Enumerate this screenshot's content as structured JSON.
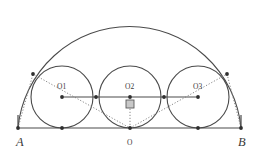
{
  "figure": {
    "background_color": "#ffffff",
    "stroke_color": "#4a4a4a",
    "dotted_color": "#7a7a7a",
    "label_color": "#3a3a3a",
    "width": 259,
    "height": 152
  },
  "labels": {
    "A": "A",
    "B": "B",
    "O": "O",
    "O1": "O1",
    "O2": "O2",
    "O3": "O3"
  },
  "chart_data": {
    "type": "diagram",
    "baseline": {
      "x1": 18,
      "y1": 128,
      "x2": 241,
      "y2": 128
    },
    "points": [
      {
        "name": "A",
        "x": 18,
        "y": 128,
        "label": "A",
        "label_x": 16,
        "label_y": 146,
        "marker": "dot"
      },
      {
        "name": "B",
        "x": 241,
        "y": 128,
        "label": "B",
        "label_x": 238,
        "label_y": 146,
        "marker": "dot"
      },
      {
        "name": "O",
        "x": 130,
        "y": 128,
        "label": "O",
        "label_x": 127,
        "label_y": 145,
        "marker": "dot"
      },
      {
        "name": "O1",
        "x": 62,
        "y": 97,
        "label": "O1",
        "label_x": 57,
        "label_y": 89,
        "marker": "dot"
      },
      {
        "name": "O2",
        "x": 130,
        "y": 97,
        "label": "O2",
        "label_x": 125,
        "label_y": 89,
        "marker": "dot"
      },
      {
        "name": "O3",
        "x": 198,
        "y": 97,
        "label": "O3",
        "label_x": 193,
        "label_y": 89,
        "marker": "dot"
      },
      {
        "name": "T_A",
        "x": 62,
        "y": 128,
        "label": "",
        "marker": "dot"
      },
      {
        "name": "T_B",
        "x": 198,
        "y": 128,
        "label": "",
        "marker": "dot"
      },
      {
        "name": "P_left",
        "x": 33,
        "y": 74,
        "label": "",
        "marker": "dot"
      },
      {
        "name": "P_right",
        "x": 227,
        "y": 74,
        "label": "",
        "marker": "dot"
      },
      {
        "name": "Q_left",
        "x": 96,
        "y": 97,
        "label": "",
        "marker": "dot"
      },
      {
        "name": "Q_right",
        "x": 164,
        "y": 97,
        "label": "",
        "marker": "dot"
      }
    ],
    "semicircle": {
      "cx": 130,
      "cy": 128,
      "r": 112,
      "start_x": 18,
      "end_x": 241
    },
    "circles": [
      {
        "name": "circle-1",
        "cx": 62,
        "cy": 97,
        "r": 31
      },
      {
        "name": "circle-2",
        "cx": 130,
        "cy": 97,
        "r": 31
      },
      {
        "name": "circle-3",
        "cx": 198,
        "cy": 97,
        "r": 31
      }
    ],
    "solid_segments": [
      {
        "name": "baseline-AB",
        "x1": 18,
        "y1": 128,
        "x2": 241,
        "y2": 128
      },
      {
        "name": "centers-line",
        "x1": 62,
        "y1": 97,
        "x2": 198,
        "y2": 97
      },
      {
        "name": "left-vertical",
        "x1": 18,
        "y1": 128,
        "x2": 18,
        "y2": 115
      },
      {
        "name": "right-vertical",
        "x1": 241,
        "y1": 128,
        "x2": 241,
        "y2": 115
      }
    ],
    "dotted_segments": [
      {
        "name": "A-to-P-left",
        "x1": 18,
        "y1": 128,
        "x2": 33,
        "y2": 74
      },
      {
        "name": "P-left-to-O",
        "x1": 33,
        "y1": 74,
        "x2": 130,
        "y2": 128
      },
      {
        "name": "O-to-P-right",
        "x1": 130,
        "y1": 128,
        "x2": 227,
        "y2": 74
      },
      {
        "name": "P-right-to-B",
        "x1": 227,
        "y1": 74,
        "x2": 241,
        "y2": 128
      },
      {
        "name": "O-to-O2-vertical",
        "x1": 130,
        "y1": 128,
        "x2": 130,
        "y2": 97
      }
    ],
    "right_angle_marker": {
      "x": 126,
      "y": 100,
      "size": 8
    }
  }
}
